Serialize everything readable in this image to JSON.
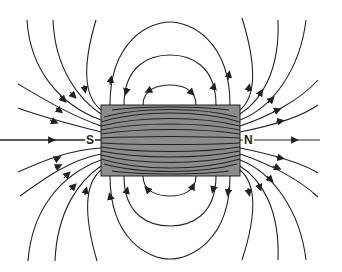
{
  "diagram": {
    "magnet": {
      "x": 101,
      "y": 105,
      "width": 139,
      "height": 71,
      "fill": "#8c8c8c",
      "stroke": "#222222",
      "south_label": "S",
      "north_label": "N"
    },
    "line_color": "#222222",
    "field_direction": "lines exit N pole (right) and enter S pole (left); inside magnet run from S to N"
  }
}
